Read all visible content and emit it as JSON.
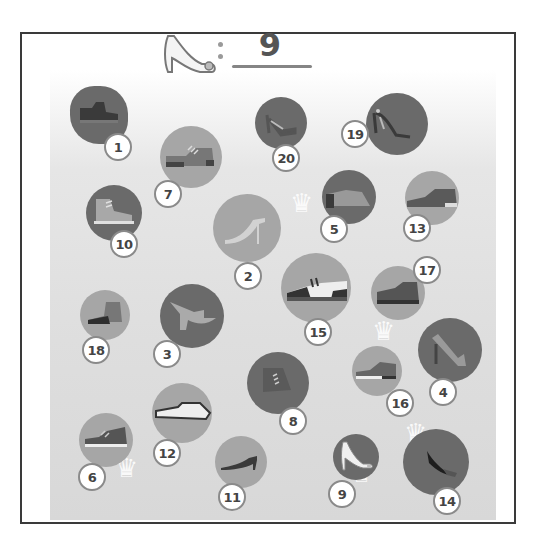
{
  "header": {
    "target_icon": "high-heel-shoe-icon",
    "separator": ":",
    "target_count": "9"
  },
  "items": [
    {
      "number": "1",
      "shoe": "boot-icon",
      "found": true
    },
    {
      "number": "2",
      "shoe": "stiletto-heel-icon"
    },
    {
      "number": "3",
      "shoe": "block-heel-mule-icon"
    },
    {
      "number": "4",
      "shoe": "pump-heel-icon"
    },
    {
      "number": "5",
      "shoe": "ankle-bootie-icon"
    },
    {
      "number": "6",
      "shoe": "sneaker-icon"
    },
    {
      "number": "7",
      "shoe": "oxford-shoe-icon"
    },
    {
      "number": "8",
      "shoe": "ankle-boot-icon"
    },
    {
      "number": "9",
      "shoe": "high-heel-shoe-icon"
    },
    {
      "number": "10",
      "shoe": "high-top-sneaker-icon"
    },
    {
      "number": "11",
      "shoe": "kitten-heel-icon"
    },
    {
      "number": "12",
      "shoe": "loafer-icon"
    },
    {
      "number": "13",
      "shoe": "brogue-shoe-icon"
    },
    {
      "number": "14",
      "shoe": "slipper-heel-icon"
    },
    {
      "number": "15",
      "shoe": "saddle-shoe-icon"
    },
    {
      "number": "16",
      "shoe": "running-shoe-icon"
    },
    {
      "number": "17",
      "shoe": "derby-shoe-icon"
    },
    {
      "number": "18",
      "shoe": "high-top-boot-icon"
    },
    {
      "number": "19",
      "shoe": "strappy-heel-icon"
    },
    {
      "number": "20",
      "shoe": "heel-sandal-icon"
    }
  ],
  "colors": {
    "frame_border": "#3a3a3a",
    "disc_dark": "#6a6a6a",
    "disc_mid": "#8e8e8e",
    "disc_light": "#a6a6a6",
    "badge_border": "#8a8a8a",
    "badge_text": "#444444"
  }
}
